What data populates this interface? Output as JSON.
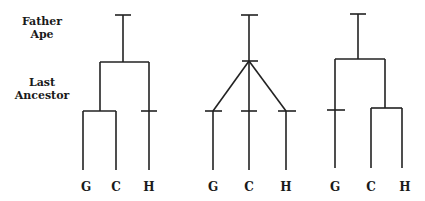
{
  "labels": {
    "father_ape": "Father Ape",
    "father_ape_line1": "Father",
    "father_ape_line2": "Ape",
    "last_ancestor_line1": "Last",
    "last_ancestor_line2": "Ancestor"
  },
  "trees": [
    {
      "name": "tree-gc-grouping",
      "leaves": [
        "G",
        "C",
        "H"
      ]
    },
    {
      "name": "tree-trichotomy",
      "leaves": [
        "G",
        "C",
        "H"
      ]
    },
    {
      "name": "tree-ch-grouping",
      "leaves": [
        "G",
        "C",
        "H"
      ]
    }
  ],
  "colors": {
    "line": "#222222",
    "text": "#1a1a1a",
    "background": "#ffffff"
  }
}
